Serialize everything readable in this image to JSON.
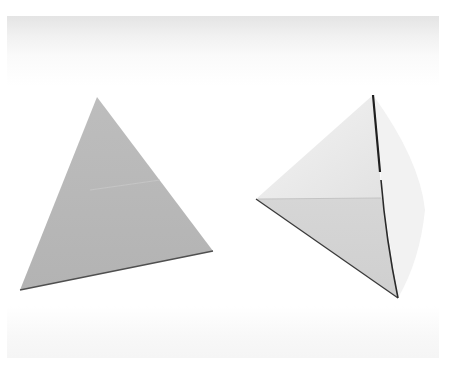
{
  "scene": {
    "description": "Two folded paper triangles on a white background",
    "background_color": "#ffffff",
    "objects": [
      {
        "name": "flat-gray-triangle",
        "fill": "#b9b9b9",
        "edge": "#555555"
      },
      {
        "name": "folded-white-triangle",
        "fill": "#ececec",
        "shade": "#d4d4d4",
        "edge": "#222222"
      }
    ]
  }
}
